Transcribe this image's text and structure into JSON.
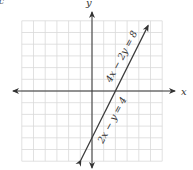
{
  "panel_label": "c",
  "chart_data": {
    "type": "line",
    "title": "",
    "xlabel": "x",
    "ylabel": "y",
    "xlim": [
      -6,
      6
    ],
    "ylim": [
      -6,
      6
    ],
    "grid": true,
    "tick_labels": false,
    "series": [
      {
        "name": "4x − 2y = 8",
        "equation": "4x - 2y = 8",
        "slope": 2,
        "intercept": -4,
        "x": [
          -0.95,
          4.8
        ],
        "y": [
          -5.9,
          5.6
        ],
        "arrows": "both"
      },
      {
        "name": "2x − y = 4",
        "equation": "2x - y = 4",
        "slope": 2,
        "intercept": -4,
        "x": [
          -0.95,
          4.8
        ],
        "y": [
          -5.9,
          5.6
        ],
        "arrows": "both"
      }
    ],
    "annotations": [
      {
        "text": "4x − 2y = 8",
        "position": "above line, upper right"
      },
      {
        "text": "2x − y = 4",
        "position": "below line, lower middle"
      }
    ],
    "note": "Both equations describe the same (coincident) line"
  },
  "labels": {
    "x_axis": "x",
    "y_axis": "y",
    "eq_upper": "4x − 2y = 8",
    "eq_lower": "2x − y = 4"
  },
  "colors": {
    "grid": "#d9d9d9",
    "axis": "#333333",
    "line": "#3a3a3a",
    "text": "#444444"
  }
}
